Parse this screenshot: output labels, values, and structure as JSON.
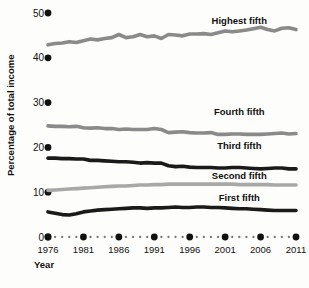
{
  "chart_data": {
    "type": "line",
    "title": "",
    "xlabel": "Year",
    "ylabel": "Percentage of total income",
    "xlim": [
      1976,
      2011
    ],
    "ylim": [
      0,
      50
    ],
    "yticks": [
      0,
      10,
      20,
      30,
      40,
      50
    ],
    "xticks": [
      1976,
      1981,
      1986,
      1991,
      1996,
      2001,
      2006,
      2011
    ],
    "grid": false,
    "legend_position": "inline-right",
    "x": [
      1976,
      1977,
      1978,
      1979,
      1980,
      1981,
      1982,
      1983,
      1984,
      1985,
      1986,
      1987,
      1988,
      1989,
      1990,
      1991,
      1992,
      1993,
      1994,
      1995,
      1996,
      1997,
      1998,
      1999,
      2000,
      2001,
      2002,
      2003,
      2004,
      2005,
      2006,
      2007,
      2008,
      2009,
      2010,
      2011
    ],
    "series": [
      {
        "name": "Highest fifth",
        "color": "#8a8a8a",
        "label_x": 2003,
        "label_y": 47.6,
        "values": [
          43.3,
          43.6,
          43.7,
          44.1,
          43.7,
          44.4,
          45.0,
          44.7,
          44.9,
          45.3,
          46.1,
          45.2,
          45.5,
          46.0,
          45.4,
          45.7,
          45.0,
          47.5,
          47.3,
          47.0,
          47.5,
          47.5,
          47.6,
          47.4,
          47.8,
          48.3,
          48.0,
          48.3,
          48.5,
          48.9,
          49.2,
          48.6,
          48.3,
          49.0,
          49.1,
          48.6
        ],
        "display_values": [
          42.9,
          43.2,
          43.3,
          43.6,
          43.4,
          43.8,
          44.2,
          44.0,
          44.3,
          44.5,
          45.2,
          44.5,
          44.7,
          45.2,
          44.7,
          44.9,
          44.3,
          45.2,
          45.1,
          44.9,
          45.3,
          45.3,
          45.4,
          45.2,
          45.6,
          46.0,
          45.8,
          46.0,
          46.2,
          46.5,
          46.8,
          46.3,
          46.0,
          46.6,
          46.7,
          46.3
        ]
      },
      {
        "name": "Fourth fifth",
        "color": "#8a8a8a",
        "label_x": 2003,
        "label_y": 27.2,
        "values": [
          24.8,
          24.7,
          24.7,
          24.6,
          24.7,
          24.4,
          24.3,
          24.4,
          24.2,
          24.2,
          24.0,
          24.1,
          24.0,
          24.0,
          24.0,
          24.2,
          24.0,
          23.3,
          23.4,
          23.5,
          23.3,
          23.2,
          23.2,
          23.3,
          22.9,
          22.9,
          23.0,
          23.0,
          22.9,
          22.9,
          22.9,
          23.0,
          23.1,
          23.2,
          23.0,
          23.1
        ]
      },
      {
        "name": "Third fifth",
        "color": "#1a1a1a",
        "label_x": 2003,
        "label_y": 19.7,
        "values": [
          17.6,
          17.6,
          17.5,
          17.5,
          17.4,
          17.4,
          17.1,
          17.1,
          17.0,
          16.9,
          16.8,
          16.8,
          16.7,
          16.5,
          16.6,
          16.5,
          16.5,
          15.9,
          15.7,
          15.8,
          15.6,
          15.5,
          15.5,
          15.5,
          15.4,
          15.4,
          15.5,
          15.5,
          15.4,
          15.3,
          15.2,
          15.3,
          15.4,
          15.4,
          15.2,
          15.2
        ]
      },
      {
        "name": "Second fifth",
        "color": "#a8a8a8",
        "label_x": 2003,
        "label_y": 13.0,
        "values": [
          10.3,
          10.3,
          10.3,
          10.3,
          10.2,
          10.1,
          10.0,
          9.9,
          9.9,
          9.8,
          9.7,
          9.6,
          9.6,
          9.5,
          9.6,
          9.6,
          9.4,
          9.0,
          9.0,
          9.1,
          9.0,
          8.9,
          9.0,
          8.9,
          8.9,
          8.7,
          8.8,
          8.7,
          8.7,
          8.6,
          8.6,
          8.7,
          8.6,
          8.6,
          8.4,
          8.4
        ],
        "display_values": [
          10.4,
          10.5,
          10.6,
          10.7,
          10.8,
          10.9,
          11.0,
          11.1,
          11.2,
          11.3,
          11.4,
          11.4,
          11.5,
          11.6,
          11.6,
          11.7,
          11.7,
          11.8,
          11.8,
          11.8,
          11.8,
          11.8,
          11.8,
          11.8,
          11.8,
          11.8,
          11.8,
          11.7,
          11.7,
          11.7,
          11.7,
          11.7,
          11.6,
          11.6,
          11.6,
          11.6
        ]
      },
      {
        "name": "First fifth",
        "color": "#1a1a1a",
        "label_x": 2003,
        "label_y": 8.1,
        "values": [
          4.4,
          4.4,
          4.3,
          4.2,
          4.3,
          4.2,
          4.1,
          4.1,
          4.1,
          4.0,
          3.9,
          3.8,
          3.8,
          3.8,
          3.9,
          3.8,
          3.8,
          3.6,
          3.6,
          3.7,
          3.6,
          3.6,
          3.6,
          3.6,
          3.6,
          3.5,
          3.5,
          3.4,
          3.4,
          3.4,
          3.4,
          3.4,
          3.4,
          3.4,
          3.3,
          3.2
        ],
        "display_values": [
          5.6,
          5.3,
          5.0,
          4.9,
          5.2,
          5.6,
          5.8,
          6.0,
          6.1,
          6.2,
          6.3,
          6.4,
          6.5,
          6.5,
          6.4,
          6.5,
          6.5,
          6.6,
          6.7,
          6.6,
          6.6,
          6.7,
          6.7,
          6.6,
          6.6,
          6.5,
          6.4,
          6.3,
          6.3,
          6.2,
          6.1,
          6.0,
          5.9,
          5.9,
          5.9,
          5.9
        ]
      }
    ]
  },
  "axes": {
    "y_title": "Percentage of total income",
    "x_title": "Year",
    "y_tick_labels": [
      "50",
      "40",
      "30",
      "20",
      "10",
      "0"
    ],
    "x_tick_labels": [
      "1976",
      "1981",
      "1986",
      "1991",
      "1996",
      "2001",
      "2006",
      "2011"
    ]
  },
  "series_labels": {
    "highest": "Highest fifth",
    "fourth": "Fourth fifth",
    "third": "Third fifth",
    "second": "Second fifth",
    "first": "First fifth"
  },
  "colors": {
    "highest_fifth": "#8a8a8a",
    "fourth_fifth": "#8a8a8a",
    "third_fifth": "#1a1a1a",
    "second_fifth": "#a8a8a8",
    "first_fifth": "#1a1a1a",
    "axis": "#111111",
    "background": "#fdfdfb"
  }
}
